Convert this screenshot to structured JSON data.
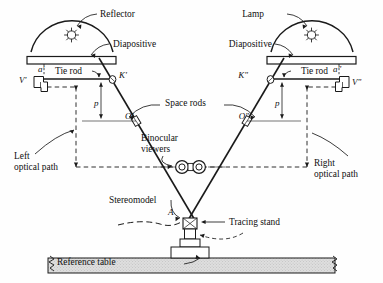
{
  "figure": {
    "type": "diagram",
    "background_color": "#fefefe",
    "line_color": "#1a1a1a",
    "table_fill_color": "#dcdcdc"
  },
  "labels": {
    "reflector": "Reflector",
    "lamp": "Lamp",
    "diapositive_left": "Diapositive",
    "diapositive_right": "Diapositive",
    "tie_rod_left": "Tie rod",
    "tie_rod_right": "Tie rod",
    "space_rods": "Space rods",
    "binocular_viewers_line1": "Binocular",
    "binocular_viewers_line2": "viewers",
    "left_optical_path_line1": "Left",
    "left_optical_path_line2": "optical path",
    "right_optical_path_line1": "Right",
    "right_optical_path_line2": "optical path",
    "stereomodel": "Stereomodel",
    "tracing_stand": "Tracing stand",
    "reference_table": "Reference table"
  },
  "point_labels": {
    "a_prime": "a'",
    "a_double_prime": "a\"",
    "v_prime": "V'",
    "v_double_prime": "V\"",
    "k_prime": "K'",
    "k_double_prime": "K\"",
    "o_prime": "O'",
    "o_double_prime": "O\"",
    "p_left": "p",
    "p_right": "p",
    "model_point_a": "A"
  }
}
